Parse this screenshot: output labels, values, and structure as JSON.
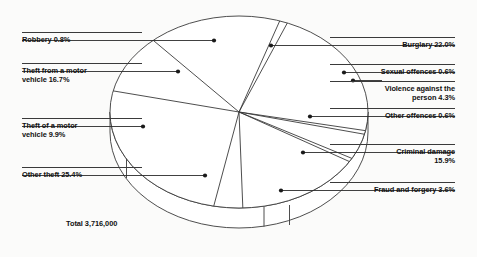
{
  "chart_data": {
    "type": "pie",
    "title": "",
    "total_label": "Total 3,716,000",
    "total_value": 3716000,
    "units": "percent of recorded offences",
    "legend_position": "callout labels around pie",
    "grid": false,
    "three_d": true,
    "categories": [
      "Burglary",
      "Sexual offences",
      "Violence against the person",
      "Other offences",
      "Criminal damage",
      "Fraud and forgery",
      "Other theft",
      "Theft of a motor vehicle",
      "Theft from a motor vehicle",
      "Robbery"
    ],
    "values": [
      22.0,
      0.6,
      4.3,
      0.6,
      15.9,
      3.6,
      25.4,
      9.9,
      16.7,
      0.8
    ],
    "slices": [
      {
        "label": "Burglary 22.0%",
        "name": "Burglary",
        "value": 22.0,
        "start_deg": -68.0,
        "end_deg": 11.2,
        "side": "right"
      },
      {
        "label": "Sexual offences 0.6%",
        "name": "Sexual offences",
        "value": 0.6,
        "start_deg": 11.2,
        "end_deg": 13.4,
        "side": "right"
      },
      {
        "label": "Violence against the\nperson 4.3%",
        "name": "Violence against the person",
        "value": 4.3,
        "start_deg": 13.4,
        "end_deg": 28.9,
        "side": "right"
      },
      {
        "label": "Other offences 0.6%",
        "name": "Other offences",
        "value": 0.6,
        "start_deg": 28.9,
        "end_deg": 31.1,
        "side": "right"
      },
      {
        "label": "Criminal damage\n15.9%",
        "name": "Criminal damage",
        "value": 15.9,
        "start_deg": 31.1,
        "end_deg": 88.3,
        "side": "right"
      },
      {
        "label": "Fraud and forgery 3.6%",
        "name": "Fraud and forgery",
        "value": 3.6,
        "start_deg": 88.3,
        "end_deg": 101.3,
        "side": "right"
      },
      {
        "label": "Other theft 25.4%",
        "name": "Other theft",
        "value": 25.4,
        "start_deg": 101.3,
        "end_deg": 192.7,
        "side": "left"
      },
      {
        "label": "Theft of a motor\nvehicle 9.9%",
        "name": "Theft of a motor vehicle",
        "value": 9.9,
        "start_deg": 192.7,
        "end_deg": 228.3,
        "side": "left"
      },
      {
        "label": "Theft from a motor\nvehicle 16.7%",
        "name": "Theft from a motor vehicle",
        "value": 16.7,
        "start_deg": 228.3,
        "end_deg": 288.4,
        "side": "left"
      },
      {
        "label": "Robbery 0.8%",
        "name": "Robbery",
        "value": 0.8,
        "start_deg": 288.4,
        "end_deg": 292.0,
        "side": "left"
      }
    ],
    "colors": {
      "stroke": "#3a3a3a",
      "fill": "#ffffff",
      "text": "#111111",
      "background": "#fbfbfa"
    }
  },
  "labels": {
    "robbery": "Robbery 0.8%",
    "theft_from_motor_vehicle": "Theft from a motor\nvehicle 16.7%",
    "theft_of_motor_vehicle": "Theft of a motor\nvehicle 9.9%",
    "other_theft": "Other theft 25.4%",
    "total": "Total 3,716,000",
    "burglary": "Burglary 22.0%",
    "sexual_offences": "Sexual offences 0.6%",
    "violence": "Violence against the\nperson 4.3%",
    "other_offences": "Other offences 0.6%",
    "criminal_damage": "Criminal damage\n15.9%",
    "fraud_and_forgery": "Fraud and forgery 3.6%"
  }
}
